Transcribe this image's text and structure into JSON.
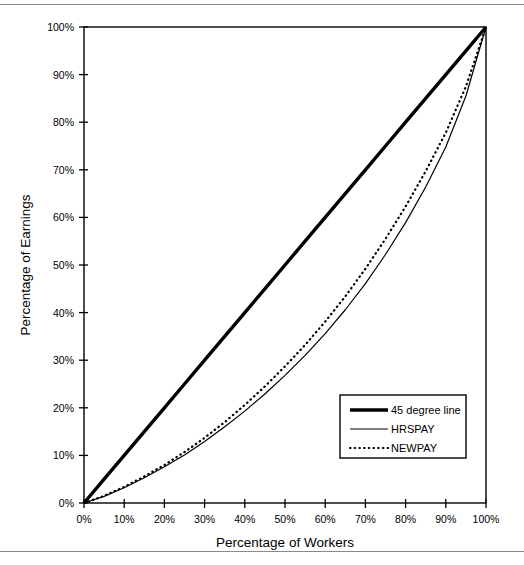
{
  "figure": {
    "top_rule": "",
    "bottom_rule": ""
  },
  "chart_data": {
    "type": "line",
    "title": "",
    "xlabel": "Percentage of Workers",
    "ylabel": "Percentage of Earnings",
    "xlim": [
      0,
      100
    ],
    "ylim": [
      0,
      100
    ],
    "grid": false,
    "legend_position": "lower-right",
    "xticks": [
      "0%",
      "10%",
      "20%",
      "30%",
      "40%",
      "50%",
      "60%",
      "70%",
      "80%",
      "90%",
      "100%"
    ],
    "yticks": [
      "0%",
      "10%",
      "20%",
      "30%",
      "40%",
      "50%",
      "60%",
      "70%",
      "80%",
      "90%",
      "100%"
    ],
    "xtick_values": [
      0,
      10,
      20,
      30,
      40,
      50,
      60,
      70,
      80,
      90,
      100
    ],
    "ytick_values": [
      0,
      10,
      20,
      30,
      40,
      50,
      60,
      70,
      80,
      90,
      100
    ],
    "x": [
      0,
      5,
      10,
      15,
      20,
      25,
      30,
      35,
      40,
      45,
      50,
      55,
      60,
      65,
      70,
      75,
      80,
      85,
      90,
      95,
      100
    ],
    "series": [
      {
        "name": "45 degree line",
        "style": "thick-solid",
        "color": "#000000",
        "values": [
          0,
          5,
          10,
          15,
          20,
          25,
          30,
          35,
          40,
          45,
          50,
          55,
          60,
          65,
          70,
          75,
          80,
          85,
          90,
          95,
          100
        ]
      },
      {
        "name": "HRSPAY",
        "style": "thin-solid",
        "color": "#000000",
        "values": [
          0,
          1.4,
          3.2,
          5.3,
          7.6,
          10.1,
          12.9,
          16.0,
          19.3,
          22.9,
          26.8,
          31.0,
          35.6,
          40.6,
          46.1,
          52.2,
          58.9,
          66.4,
          74.8,
          85.5,
          100
        ]
      },
      {
        "name": "NEWPAY",
        "style": "dotted",
        "color": "#000000",
        "values": [
          0,
          1.5,
          3.4,
          5.6,
          8.0,
          10.7,
          13.7,
          17.0,
          20.6,
          24.5,
          28.7,
          33.2,
          38.1,
          43.4,
          49.2,
          55.5,
          62.3,
          69.7,
          77.8,
          87.5,
          100
        ]
      }
    ],
    "legend": [
      {
        "label": "45 degree line",
        "style": "thick-solid"
      },
      {
        "label": "HRSPAY",
        "style": "thin-solid"
      },
      {
        "label": "NEWPAY",
        "style": "dotted"
      }
    ]
  }
}
